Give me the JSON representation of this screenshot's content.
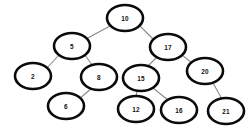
{
  "diagram": {
    "type": "binary-search-tree",
    "background_color": "#ffffff",
    "node_fill_color": "#ffffff",
    "node_stroke_color": "#0b0b0b",
    "edge_color": "#8a8a8a",
    "label_color": "#111111",
    "nodes": [
      {
        "id": "n10",
        "label": "10",
        "cx": 125,
        "cy": 18,
        "rx": 18,
        "ry": 13
      },
      {
        "id": "n5",
        "label": "5",
        "cx": 72,
        "cy": 46,
        "rx": 18,
        "ry": 13
      },
      {
        "id": "n17",
        "label": "17",
        "cx": 168,
        "cy": 47,
        "rx": 18,
        "ry": 13
      },
      {
        "id": "n2",
        "label": "2",
        "cx": 33,
        "cy": 76,
        "rx": 18,
        "ry": 13
      },
      {
        "id": "n8",
        "label": "8",
        "cx": 99,
        "cy": 77,
        "rx": 18,
        "ry": 13
      },
      {
        "id": "n15",
        "label": "15",
        "cx": 141,
        "cy": 78,
        "rx": 18,
        "ry": 13
      },
      {
        "id": "n20",
        "label": "20",
        "cx": 205,
        "cy": 71,
        "rx": 18,
        "ry": 13
      },
      {
        "id": "n6",
        "label": "6",
        "cx": 66,
        "cy": 106,
        "rx": 18,
        "ry": 13
      },
      {
        "id": "n12",
        "label": "12",
        "cx": 136,
        "cy": 109,
        "rx": 18,
        "ry": 13
      },
      {
        "id": "n16",
        "label": "16",
        "cx": 179,
        "cy": 110,
        "rx": 18,
        "ry": 13
      },
      {
        "id": "n21",
        "label": "21",
        "cx": 226,
        "cy": 111,
        "rx": 18,
        "ry": 13
      }
    ],
    "edges": [
      {
        "id": "e-10-5",
        "from": "n10",
        "to": "n5",
        "x1": 110,
        "y1": 26,
        "x2": 86,
        "y2": 39
      },
      {
        "id": "e-10-17",
        "from": "n10",
        "to": "n17",
        "x1": 140,
        "y1": 26,
        "x2": 154,
        "y2": 40
      },
      {
        "id": "e-5-2",
        "from": "n5",
        "to": "n2",
        "x1": 59,
        "y1": 55,
        "x2": 46,
        "y2": 69
      },
      {
        "id": "e-5-8",
        "from": "n5",
        "to": "n8",
        "x1": 85,
        "y1": 55,
        "x2": 92,
        "y2": 65
      },
      {
        "id": "e-8-6",
        "from": "n8",
        "to": "n6",
        "x1": 92,
        "y1": 88,
        "x2": 79,
        "y2": 99
      },
      {
        "id": "e-17-15",
        "from": "n17",
        "to": "n15",
        "x1": 157,
        "y1": 57,
        "x2": 148,
        "y2": 66
      },
      {
        "id": "e-17-20",
        "from": "n17",
        "to": "n20",
        "x1": 182,
        "y1": 55,
        "x2": 192,
        "y2": 63
      },
      {
        "id": "e-15-12",
        "from": "n15",
        "to": "n12",
        "x1": 137,
        "y1": 91,
        "x2": 136,
        "y2": 97
      },
      {
        "id": "e-15-16",
        "from": "n15",
        "to": "n16",
        "x1": 153,
        "y1": 88,
        "x2": 168,
        "y2": 100
      },
      {
        "id": "e-20-21",
        "from": "n20",
        "to": "n21",
        "x1": 213,
        "y1": 83,
        "x2": 222,
        "y2": 99
      }
    ]
  }
}
